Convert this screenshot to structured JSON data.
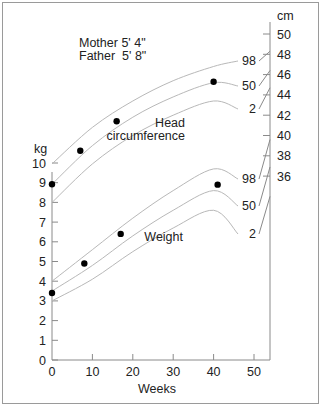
{
  "chart_data": {
    "type": "line",
    "title": "",
    "annotation": {
      "mother": "Mother 5' 4\"",
      "father": "Father  5' 8\""
    },
    "xlabel": "Weeks",
    "x_ticks": [
      0,
      10,
      20,
      30,
      40,
      50
    ],
    "xlim": [
      0,
      53
    ],
    "left_axis": {
      "label": "kg",
      "ticks": [
        0,
        1,
        2,
        3,
        4,
        5,
        6,
        7,
        8,
        9,
        10
      ],
      "ylim": [
        0,
        10
      ]
    },
    "right_axis": {
      "label": "cm",
      "ticks": [
        36,
        38,
        40,
        42,
        44,
        46,
        48,
        50
      ],
      "ylim": [
        35,
        50
      ]
    },
    "groups": [
      {
        "name": "Head circumference",
        "axis": "right",
        "centiles": [
          {
            "name": "98",
            "x": [
              0,
              10,
              20,
              30,
              40,
              50
            ],
            "y": [
              37.2,
              40.8,
              43.4,
              45.4,
              46.8,
              47.6
            ]
          },
          {
            "name": "50",
            "x": [
              0,
              10,
              20,
              30,
              40,
              50
            ],
            "y": [
              35.2,
              39.0,
              41.8,
              43.8,
              45.2,
              46.2
            ]
          },
          {
            "name": "2",
            "x": [
              0,
              10,
              20,
              30,
              40,
              50
            ],
            "y": [
              33.4,
              37.2,
              40.0,
              42.0,
              43.4,
              44.6
            ]
          }
        ],
        "points": {
          "x": [
            0,
            7,
            16,
            40
          ],
          "y": [
            35.2,
            38.5,
            41.4,
            45.3
          ]
        }
      },
      {
        "name": "Weight",
        "axis": "left",
        "centiles": [
          {
            "name": "98",
            "x": [
              0,
              10,
              20,
              30,
              40,
              50
            ],
            "y": [
              4.0,
              5.6,
              7.2,
              8.6,
              9.7,
              10.4
            ]
          },
          {
            "name": "50",
            "x": [
              0,
              10,
              20,
              30,
              40,
              50
            ],
            "y": [
              3.5,
              4.8,
              6.3,
              7.6,
              8.6,
              9.4
            ]
          },
          {
            "name": "2",
            "x": [
              0,
              10,
              20,
              30,
              40,
              50
            ],
            "y": [
              3.0,
              4.1,
              5.5,
              6.7,
              7.6,
              8.3
            ]
          }
        ],
        "points": {
          "x": [
            0,
            8,
            17,
            41
          ],
          "y": [
            3.4,
            4.9,
            6.4,
            8.9
          ]
        }
      }
    ],
    "group_labels": {
      "head": [
        "Head",
        "circumference"
      ],
      "weight": "Weight"
    },
    "grid": false,
    "legend": "none"
  }
}
